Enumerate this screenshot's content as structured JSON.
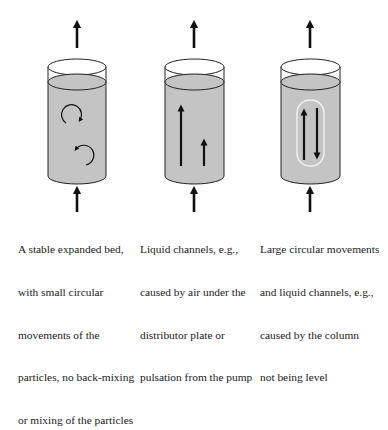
{
  "figure": {
    "colors": {
      "liquid": "#c4c4c4",
      "outline": "#222222",
      "arrow": "#111111",
      "channel_highlight": "#f0f0f0"
    },
    "columns": [
      {
        "id": "stable-bed",
        "flow_in_arrow": "up",
        "flow_out_arrow": "up",
        "internal_marks": [
          "clockwise-circular-arrow",
          "counterclockwise-circular-arrow"
        ],
        "caption_lines": [
          "A stable expanded bed,",
          "with small circular",
          "movements of the",
          "particles, no back-mixing",
          "or mixing of the particles"
        ]
      },
      {
        "id": "liquid-channels",
        "flow_in_arrow": "up",
        "flow_out_arrow": "up",
        "internal_marks": [
          "long-up-arrow",
          "short-up-arrow"
        ],
        "caption_lines": [
          "Liquid channels, e.g.,",
          "caused by air under the",
          "distributor plate or",
          "pulsation from the pump"
        ]
      },
      {
        "id": "large-circular-movements",
        "flow_in_arrow": "up",
        "flow_out_arrow": "up",
        "internal_marks": [
          "up-arrow",
          "down-arrow",
          "rounded-channel-outline"
        ],
        "caption_lines": [
          "Large circular movements",
          "and liquid channels, e.g.,",
          "caused by the column",
          "not being level"
        ]
      }
    ]
  }
}
